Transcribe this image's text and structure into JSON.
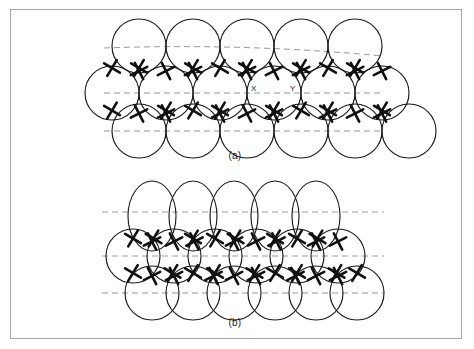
{
  "figure": {
    "background_color": "#ffffff",
    "frame_color": "#a8a8a8",
    "outline_color": "#1a1a1a",
    "dashed_line_color": "#999999",
    "cross_color": "#111111",
    "width": 474,
    "height": 349
  },
  "panels": [
    {
      "id": "a",
      "caption": "(a)",
      "description": "close-packed circles, three stacked rows with interstitial cross markings",
      "rows": [
        {
          "name": "top-row",
          "shape": "circle",
          "count": 5,
          "radius_x": 27,
          "radius_y": 27,
          "start_x": 139,
          "spacing": 54,
          "center_y": 46
        },
        {
          "name": "middle-row",
          "shape": "circle",
          "count": 6,
          "radius_x": 27,
          "radius_y": 27,
          "start_x": 112,
          "spacing": 54,
          "center_y": 93
        },
        {
          "name": "bottom-row",
          "shape": "circle",
          "count": 6,
          "radius_x": 27,
          "radius_y": 27,
          "start_x": 139,
          "spacing": 54,
          "center_y": 131
        }
      ],
      "dashed_lines": [
        {
          "name": "upper-dashed-curve",
          "x1": 104,
          "y1": 48,
          "x2": 383,
          "y2": 56,
          "curved": true,
          "sag": -9
        },
        {
          "name": "middle-dashed-line",
          "x1": 104,
          "y1": 93,
          "x2": 383,
          "y2": 93,
          "curved": false
        },
        {
          "name": "lower-dashed-line",
          "x1": 104,
          "y1": 131,
          "x2": 383,
          "y2": 131,
          "curved": false
        }
      ],
      "site_labels": [
        {
          "text": "X",
          "x": 251,
          "y": 84
        },
        {
          "text": "Y",
          "x": 290,
          "y": 84
        }
      ]
    },
    {
      "id": "b",
      "caption": "(b)",
      "description": "top row of vertically elongated ellipses over two close-packed circle rows",
      "rows": [
        {
          "name": "top-row",
          "shape": "ellipse",
          "count": 5,
          "radius_x": 24,
          "radius_y": 35,
          "start_x": 152,
          "spacing": 41,
          "center_y": 216
        },
        {
          "name": "middle-row",
          "shape": "circle",
          "count": 6,
          "radius_x": 27,
          "radius_y": 27,
          "start_x": 133,
          "spacing": 41,
          "center_y": 256
        },
        {
          "name": "bottom-row",
          "shape": "circle",
          "count": 6,
          "radius_x": 27,
          "radius_y": 27,
          "start_x": 152,
          "spacing": 41,
          "center_y": 293
        }
      ],
      "dashed_lines": [
        {
          "name": "upper-dashed-line",
          "x1": 102,
          "y1": 212,
          "x2": 384,
          "y2": 212,
          "curved": false
        },
        {
          "name": "middle-dashed-line",
          "x1": 102,
          "y1": 256,
          "x2": 384,
          "y2": 256,
          "curved": false
        },
        {
          "name": "lower-dashed-line",
          "x1": 102,
          "y1": 293,
          "x2": 384,
          "y2": 293,
          "curved": false
        }
      ],
      "site_labels": []
    }
  ]
}
